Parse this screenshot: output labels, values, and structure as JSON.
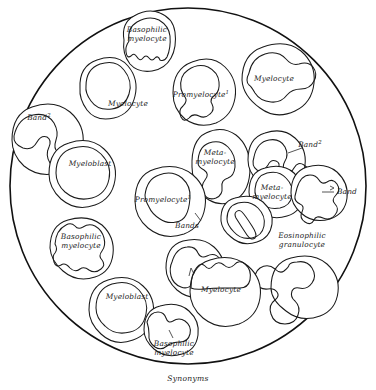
{
  "figure": {
    "caption": "Synonyms",
    "field_circle": {
      "cx": 188,
      "cy": 186,
      "r": 178
    },
    "colors": {
      "ink": "#1a1a1a",
      "field_stroke": "#111111",
      "background": "#ffffff"
    }
  },
  "cells": [
    {
      "id": "basophilic-myelocyte-top",
      "label_lines": [
        "Basophilic",
        "myelocyte"
      ],
      "label_x": 147,
      "label_y": 34,
      "superscript": "",
      "cx": 146,
      "cy": 44,
      "rx": 24,
      "ry": 29,
      "type": "basophilic-myelocyte"
    },
    {
      "id": "myelocyte-upper-left",
      "label_lines": [
        "Myelocyte"
      ],
      "label_x": 128,
      "label_y": 104,
      "superscript": "",
      "cx": 105,
      "cy": 92,
      "rx": 25,
      "ry": 28,
      "type": "myelocyte"
    },
    {
      "id": "promyelocyte-top",
      "label_lines": [
        "Promyelocyte"
      ],
      "label_x": 201,
      "label_y": 95,
      "superscript": "1",
      "cx": 202,
      "cy": 93,
      "rx": 29,
      "ry": 30,
      "type": "promyelocyte"
    },
    {
      "id": "myelocyte-top-right",
      "label_lines": [
        "Myelocyte"
      ],
      "label_x": 274,
      "label_y": 79,
      "superscript": "",
      "cx": 274,
      "cy": 80,
      "rx": 32,
      "ry": 33,
      "type": "myelocyte-bilobed"
    },
    {
      "id": "band-left",
      "label_lines": [
        "Band"
      ],
      "label_x": 39,
      "label_y": 118,
      "superscript": "2",
      "cx": 43,
      "cy": 141,
      "rx": 32,
      "ry": 32,
      "type": "band"
    },
    {
      "id": "myeloblast-left",
      "label_lines": [
        "Myeloblast"
      ],
      "label_x": 90,
      "label_y": 164,
      "superscript": "",
      "cx": 78,
      "cy": 175,
      "rx": 29,
      "ry": 30,
      "type": "myeloblast"
    },
    {
      "id": "metamyelocyte-center",
      "label_lines": [
        "Meta-",
        "myelocyte"
      ],
      "label_x": 215,
      "label_y": 157,
      "superscript": "",
      "cx": 216,
      "cy": 168,
      "rx": 24,
      "ry": 31,
      "type": "metamyelocyte"
    },
    {
      "id": "band-upper-right",
      "label_lines": [
        "Band"
      ],
      "label_x": 310,
      "label_y": 145,
      "superscript": "2",
      "cx": 272,
      "cy": 160,
      "rx": 25,
      "ry": 25,
      "type": "band"
    },
    {
      "id": "promyelocyte-center",
      "label_lines": [
        "Promyelocyte"
      ],
      "label_x": 163,
      "label_y": 200,
      "superscript": "1",
      "cx": 165,
      "cy": 201,
      "rx": 30,
      "ry": 31,
      "type": "promyelocyte"
    },
    {
      "id": "metamyelocyte-right",
      "label_lines": [
        "Meta-",
        "myelocyte"
      ],
      "label_x": 272,
      "label_y": 192,
      "superscript": "",
      "cx": 271,
      "cy": 192,
      "rx": 23,
      "ry": 23,
      "type": "metamyelocyte"
    },
    {
      "id": "band-right-edge",
      "label_lines": [
        "Band"
      ],
      "label_x": 345,
      "label_y": 192,
      "superscript": "",
      "cx": 313,
      "cy": 193,
      "rx": 23,
      "ry": 24,
      "type": "band-segmented"
    },
    {
      "id": "bands-center",
      "label_lines": [
        "Bands"
      ],
      "label_x": 187,
      "label_y": 226,
      "superscript": "",
      "cx": 245,
      "cy": 222,
      "rx": 25,
      "ry": 22,
      "type": "band-rod"
    },
    {
      "id": "eosinophilic-granulocyte",
      "label_lines": [
        "Eosinophilic",
        "granulocyte"
      ],
      "label_x": 302,
      "label_y": 240,
      "superscript": "",
      "cx": 300,
      "cy": 288,
      "rx": 29,
      "ry": 29,
      "type": "eosinophil"
    },
    {
      "id": "basophilic-myelocyte-left",
      "label_lines": [
        "Basophilic",
        "myelocyte"
      ],
      "label_x": 81,
      "label_y": 241,
      "superscript": "",
      "cx": 76,
      "cy": 248,
      "rx": 26,
      "ry": 27,
      "type": "basophilic-myelocyte"
    },
    {
      "id": "myelocyte-lower-center",
      "label_lines": [
        "Myelocyte"
      ],
      "label_x": 221,
      "label_y": 290,
      "superscript": "",
      "cx": 220,
      "cy": 292,
      "rx": 30,
      "ry": 31,
      "type": "myelocyte-capped"
    },
    {
      "id": "myelocyte-partial-left",
      "label_lines": [],
      "label_x": 0,
      "label_y": 0,
      "superscript": "",
      "cx": 190,
      "cy": 268,
      "rx": 24,
      "ry": 25,
      "type": "myelocyte-partial"
    },
    {
      "id": "myeloblast-bottom",
      "label_lines": [
        "Myeloblast"
      ],
      "label_x": 127,
      "label_y": 297,
      "superscript": "",
      "cx": 117,
      "cy": 310,
      "rx": 27,
      "ry": 28,
      "type": "myeloblast"
    },
    {
      "id": "basophilic-myelocyte-bottom",
      "label_lines": [
        "Basophilic",
        "myelocyte"
      ],
      "label_x": 174,
      "label_y": 344,
      "superscript": "",
      "cx": 167,
      "cy": 330,
      "rx": 23,
      "ry": 23,
      "type": "basophilic-myelocyte"
    }
  ]
}
